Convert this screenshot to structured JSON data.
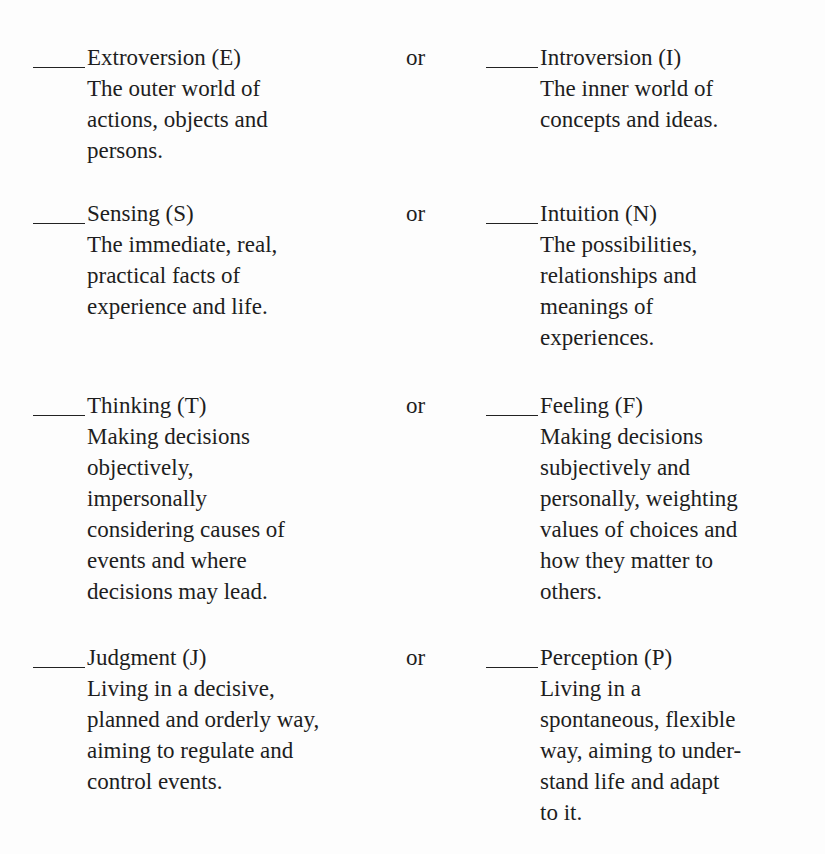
{
  "pairs": [
    {
      "connector": "or",
      "left": {
        "blank": "____",
        "heading": "Extroversion (E)",
        "description": "The outer world of\nactions, objects and\npersons."
      },
      "right": {
        "blank": "____",
        "heading": "Introversion (I)",
        "description": "The inner world of\nconcepts and ideas."
      }
    },
    {
      "connector": "or",
      "left": {
        "blank": "____",
        "heading": "Sensing (S)",
        "description": "The immediate, real,\npractical facts of\nexperience and life."
      },
      "right": {
        "blank": "____",
        "heading": "Intuition (N)",
        "description": "The possibilities,\nrelationships and\nmeanings of\nexperiences."
      }
    },
    {
      "connector": "or",
      "left": {
        "blank": "____",
        "heading": "Thinking (T)",
        "description": "Making decisions\nobjectively,\nimpersonally\nconsidering causes of\nevents and where\ndecisions may lead."
      },
      "right": {
        "blank": "____",
        "heading": "Feeling (F)",
        "description": "Making decisions\nsubjectively and\npersonally, weighting\nvalues of choices and\nhow they matter to\nothers."
      }
    },
    {
      "connector": "or",
      "left": {
        "blank": "____",
        "heading": "Judgment (J)",
        "description": "Living in a decisive,\nplanned and orderly way,\naiming to regulate and\ncontrol events."
      },
      "right": {
        "blank": "____",
        "heading": "Perception (P)",
        "description": "Living in a\nspontaneous, flexible\nway, aiming to under-\nstand life and adapt\nto it."
      }
    }
  ]
}
